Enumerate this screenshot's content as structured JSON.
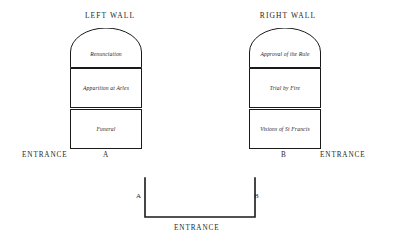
{
  "diagram": {
    "left_wall": {
      "title": "LEFT WALL",
      "panels": [
        {
          "label": "Renunciation",
          "shape": "arched"
        },
        {
          "label": "Apparition at Arles",
          "shape": "rect"
        },
        {
          "label": "Funeral",
          "shape": "rect"
        }
      ],
      "entrance_label": "ENTRANCE",
      "marker": "A"
    },
    "right_wall": {
      "title": "RIGHT WALL",
      "panels": [
        {
          "label": "Approval of the Rule",
          "shape": "arched"
        },
        {
          "label": "Trial by Fire",
          "shape": "rect"
        },
        {
          "label": "Visions of St Francis",
          "shape": "rect"
        }
      ],
      "entrance_label": "ENTRANCE",
      "marker": "B"
    },
    "floor_plan": {
      "marker_left": "A",
      "marker_right": "B",
      "entrance_label": "ENTRANCE"
    },
    "colors": {
      "ink": "#1a1a1a",
      "background": "#ffffff"
    }
  }
}
